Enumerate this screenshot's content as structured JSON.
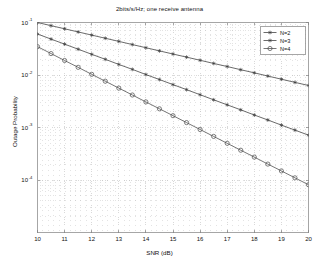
{
  "figure": {
    "window_type": "matlab-figure",
    "background": "#ffffff"
  },
  "chart_data": {
    "type": "line",
    "title": "2bits/s/Hz; one receive antenna",
    "xlabel": "SNR (dB)",
    "ylabel": "Outage Probability",
    "xscale": "linear",
    "yscale": "log",
    "xlim": [
      10,
      20
    ],
    "ylim": [
      1e-05,
      0.1
    ],
    "grid": true,
    "minor_grid": true,
    "grid_color": "#b9b9b9",
    "axes_color": "#808080",
    "legend_position": "upper right",
    "xticks": [
      10,
      11,
      12,
      13,
      14,
      15,
      16,
      17,
      18,
      19,
      20
    ],
    "xtick_labels": [
      "10",
      "11",
      "12",
      "13",
      "14",
      "15",
      "16",
      "17",
      "18",
      "19",
      "20"
    ],
    "yticks": [
      0.1,
      0.01,
      0.001,
      0.0001
    ],
    "ytick_labels": [
      "10^-1",
      "10^-2",
      "10^-3",
      "10^-4"
    ],
    "ytick_mantissa": "10",
    "ytick_exponents": [
      "-1",
      "-2",
      "-3",
      "-4"
    ],
    "x": [
      10,
      10.5,
      11,
      11.5,
      12,
      12.5,
      13,
      13.5,
      14,
      14.5,
      15,
      15.5,
      16,
      16.5,
      17,
      17.5,
      18,
      18.5,
      19,
      19.5,
      20
    ],
    "series": [
      {
        "name": "N=2",
        "label": "N=2",
        "color": "#3a3a3a",
        "marker": "star",
        "line_style": "solid",
        "values": [
          0.1,
          0.0871,
          0.0759,
          0.0661,
          0.0576,
          0.0501,
          0.0437,
          0.038,
          0.0331,
          0.0288,
          0.0251,
          0.0219,
          0.0191,
          0.0166,
          0.0145,
          0.0126,
          0.011,
          0.00955,
          0.00832,
          0.00724,
          0.00631
        ]
      },
      {
        "name": "N=3",
        "label": "N=3",
        "color": "#3a3a3a",
        "marker": "star",
        "line_style": "solid",
        "values": [
          0.0603,
          0.0483,
          0.0387,
          0.031,
          0.0248,
          0.0199,
          0.0159,
          0.0128,
          0.0102,
          0.00819,
          0.00656,
          0.00526,
          0.00421,
          0.00337,
          0.0027,
          0.00217,
          0.00173,
          0.00139,
          0.00111,
          0.000892,
          0.000715
        ]
      },
      {
        "name": "N=4",
        "label": "N=4",
        "color": "#4a4a4a",
        "marker": "circle",
        "line_style": "solid",
        "values": [
          0.0347,
          0.0256,
          0.0189,
          0.014,
          0.0103,
          0.00762,
          0.00563,
          0.00416,
          0.00307,
          0.00227,
          0.00168,
          0.00124,
          0.000915,
          0.000676,
          0.0005,
          0.000369,
          0.000273,
          0.000201,
          0.000149,
          0.00011,
          8.12e-05
        ]
      }
    ]
  },
  "legend": {
    "items": [
      {
        "label": "N=2",
        "marker": "star"
      },
      {
        "label": "N=3",
        "marker": "star"
      },
      {
        "label": "N=4",
        "marker": "circle"
      }
    ]
  }
}
